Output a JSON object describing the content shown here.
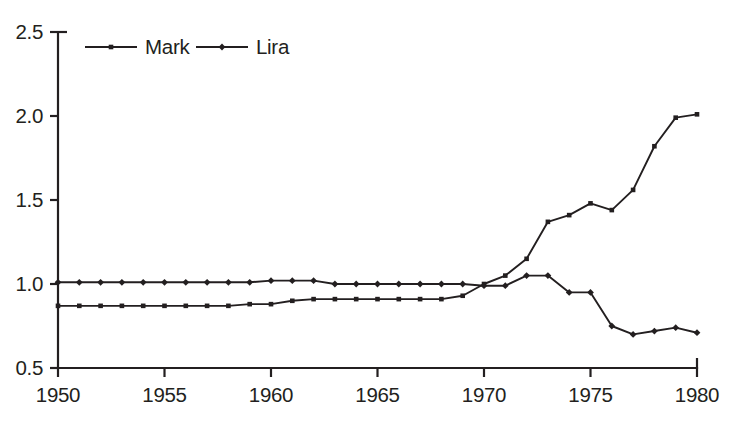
{
  "chart_data": {
    "type": "line",
    "title": "",
    "subtitle": "",
    "xlabel": "",
    "ylabel": "",
    "xlim": [
      1950,
      1980
    ],
    "ylim": [
      0.5,
      2.5
    ],
    "grid": false,
    "legend_position": "top-left",
    "x_tick_labels": [
      "1950",
      "1955",
      "1960",
      "1965",
      "1970",
      "1975",
      "1980"
    ],
    "x_ticks": [
      1950,
      1955,
      1960,
      1965,
      1970,
      1975,
      1980
    ],
    "y_tick_labels": [
      "0.5",
      "1.0",
      "1.5",
      "2.0",
      "2.5"
    ],
    "y_ticks": [
      0.5,
      1.0,
      1.5,
      2.0,
      2.5
    ],
    "x": [
      1950,
      1951,
      1952,
      1953,
      1954,
      1955,
      1956,
      1957,
      1958,
      1959,
      1960,
      1961,
      1962,
      1963,
      1964,
      1965,
      1966,
      1967,
      1968,
      1969,
      1970,
      1971,
      1972,
      1973,
      1974,
      1975,
      1976,
      1977,
      1978,
      1979,
      1980
    ],
    "series": [
      {
        "name": "Mark",
        "marker": "square",
        "color": "#231f20",
        "values": [
          0.87,
          0.87,
          0.87,
          0.87,
          0.87,
          0.87,
          0.87,
          0.87,
          0.87,
          0.88,
          0.88,
          0.9,
          0.91,
          0.91,
          0.91,
          0.91,
          0.91,
          0.91,
          0.91,
          0.93,
          1.0,
          1.05,
          1.15,
          1.37,
          1.41,
          1.48,
          1.44,
          1.56,
          1.82,
          1.99,
          2.01
        ]
      },
      {
        "name": "Lira",
        "marker": "diamond",
        "color": "#231f20",
        "values": [
          1.01,
          1.01,
          1.01,
          1.01,
          1.01,
          1.01,
          1.01,
          1.01,
          1.01,
          1.01,
          1.02,
          1.02,
          1.02,
          1.0,
          1.0,
          1.0,
          1.0,
          1.0,
          1.0,
          1.0,
          0.99,
          0.99,
          1.05,
          1.05,
          0.95,
          0.95,
          0.75,
          0.7,
          0.72,
          0.74,
          0.71
        ]
      }
    ]
  }
}
